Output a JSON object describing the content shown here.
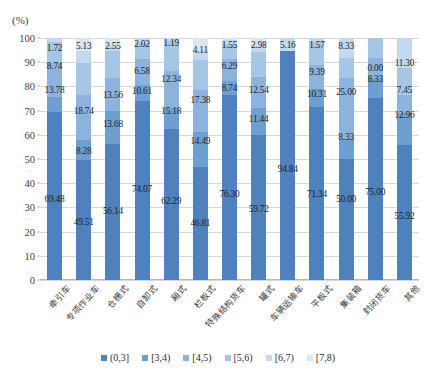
{
  "chart_data": {
    "type": "bar",
    "subtype": "stacked-100-percent",
    "title": "",
    "xlabel": "",
    "ylabel": "(%)",
    "unit_label": "(%)",
    "ylim": [
      0,
      100
    ],
    "yticks": [
      0,
      10,
      20,
      30,
      40,
      50,
      60,
      70,
      80,
      90,
      100
    ],
    "grid": true,
    "legend_position": "bottom",
    "categories": [
      "牵引车",
      "专项作业车",
      "仓栅式",
      "自卸式",
      "厢式",
      "栏板式",
      "特殊结构货车",
      "罐式",
      "车辆运输车",
      "平板式",
      "集装箱",
      "封闭货车",
      "其他"
    ],
    "series": [
      {
        "name": "(0,3]",
        "color": "#4f81bd",
        "values": [
          69.48,
          49.51,
          56.14,
          74.07,
          62.29,
          46.81,
          76.3,
          59.72,
          94.84,
          71.34,
          50.0,
          75.0,
          55.92
        ]
      },
      {
        "name": "[3,4)",
        "color": "#6f9fd0",
        "values": [
          6.28,
          8.28,
          13.68,
          6.72,
          8.81,
          14.49,
          6.12,
          11.44,
          0.0,
          7.39,
          8.33,
          8.33,
          12.96
        ]
      },
      {
        "name": "[4,5)",
        "color": "#8cb3dd",
        "values": [
          13.78,
          18.74,
          13.56,
          10.61,
          15.18,
          17.38,
          8.74,
          12.54,
          0.0,
          10.31,
          25.0,
          8.33,
          7.45
        ]
      },
      {
        "name": "[5,6)",
        "color": "#a6c6e6",
        "values": [
          8.74,
          13.13,
          11.09,
          6.58,
          12.34,
          12.11,
          6.29,
          10.34,
          0.0,
          9.39,
          8.33,
          8.33,
          11.3
        ]
      },
      {
        "name": "[6,7)",
        "color": "#c3d9ef",
        "values": [
          1.72,
          5.13,
          2.55,
          2.02,
          1.19,
          4.11,
          1.55,
          2.98,
          5.16,
          1.57,
          8.33,
          0.0,
          12.37
        ]
      },
      {
        "name": "[7,8)",
        "color": "#dce6f3",
        "values": [
          0.0,
          5.21,
          2.98,
          0.0,
          0.19,
          5.1,
          1.0,
          2.98,
          0.0,
          0.0,
          0.0,
          0.0,
          0.0
        ]
      }
    ],
    "annotations": [
      {
        "category": "牵引车",
        "labels": [
          "1.72",
          "8.74",
          "13.78",
          "69.48"
        ]
      },
      {
        "category": "专项作业车",
        "labels": [
          "5.13",
          "18.74",
          "8.28",
          "49.51"
        ]
      },
      {
        "category": "仓栅式",
        "labels": [
          "2.55",
          "13.56",
          "13.68",
          "56.14"
        ]
      },
      {
        "category": "自卸式",
        "labels": [
          "2.02",
          "6.58",
          "10.61",
          "74.07"
        ]
      },
      {
        "category": "厢式",
        "labels": [
          "1.19",
          "12.34",
          "15.18",
          "62.29"
        ]
      },
      {
        "category": "栏板式",
        "labels": [
          "4.11",
          "17.38",
          "14.49",
          "46.81"
        ]
      },
      {
        "category": "特殊结构货车",
        "labels": [
          "1.55",
          "6.29",
          "8.74",
          "76.30"
        ]
      },
      {
        "category": "罐式",
        "labels": [
          "2.98",
          "12.54",
          "11.44",
          "59.72"
        ]
      },
      {
        "category": "车辆运输车",
        "labels": [
          "5.16",
          "94.84"
        ]
      },
      {
        "category": "平板式",
        "labels": [
          "1.57",
          "9.39",
          "10.31",
          "71.34"
        ]
      },
      {
        "category": "集装箱",
        "labels": [
          "8.33",
          "25.00",
          "8.33",
          "50.00"
        ]
      },
      {
        "category": "封闭货车",
        "labels": [
          "0.00",
          "8.33",
          "75.00"
        ]
      },
      {
        "category": "其他",
        "labels": [
          "11.30",
          "7.45",
          "12.96",
          "55.92"
        ]
      }
    ],
    "value_labels": [
      {
        "col": 0,
        "text": "1.72",
        "y": 96.0
      },
      {
        "col": 0,
        "text": "8.74",
        "y": 88.5
      },
      {
        "col": 0,
        "text": "13.78",
        "y": 78.5
      },
      {
        "col": 0,
        "text": "69.48",
        "y": 33.5
      },
      {
        "col": 1,
        "text": "5.13",
        "y": 96.5
      },
      {
        "col": 1,
        "text": "18.74",
        "y": 70.0
      },
      {
        "col": 1,
        "text": "8.28",
        "y": 53.5
      },
      {
        "col": 1,
        "text": "49.51",
        "y": 24.0
      },
      {
        "col": 2,
        "text": "2.55",
        "y": 96.5
      },
      {
        "col": 2,
        "text": "13.56",
        "y": 76.5
      },
      {
        "col": 2,
        "text": "13.68",
        "y": 64.5
      },
      {
        "col": 2,
        "text": "56.14",
        "y": 28.5
      },
      {
        "col": 3,
        "text": "2.02",
        "y": 97.5
      },
      {
        "col": 3,
        "text": "6.58",
        "y": 86.5
      },
      {
        "col": 3,
        "text": "10.61",
        "y": 78.0
      },
      {
        "col": 3,
        "text": "74.07",
        "y": 37.5
      },
      {
        "col": 4,
        "text": "1.19",
        "y": 98.0
      },
      {
        "col": 4,
        "text": "12.34",
        "y": 83.0
      },
      {
        "col": 4,
        "text": "15.18",
        "y": 70.0
      },
      {
        "col": 4,
        "text": "62.29",
        "y": 32.5
      },
      {
        "col": 5,
        "text": "4.11",
        "y": 95.0
      },
      {
        "col": 5,
        "text": "17.38",
        "y": 74.5
      },
      {
        "col": 5,
        "text": "14.49",
        "y": 57.5
      },
      {
        "col": 5,
        "text": "46.81",
        "y": 23.5
      },
      {
        "col": 6,
        "text": "1.55",
        "y": 97.0
      },
      {
        "col": 6,
        "text": "6.29",
        "y": 88.5
      },
      {
        "col": 6,
        "text": "8.74",
        "y": 79.5
      },
      {
        "col": 6,
        "text": "76.30",
        "y": 35.5
      },
      {
        "col": 7,
        "text": "2.98",
        "y": 97.0
      },
      {
        "col": 7,
        "text": "12.54",
        "y": 78.5
      },
      {
        "col": 7,
        "text": "11.44",
        "y": 66.5
      },
      {
        "col": 7,
        "text": "59.72",
        "y": 29.5
      },
      {
        "col": 8,
        "text": "5.16",
        "y": 97.0
      },
      {
        "col": 8,
        "text": "94.84",
        "y": 46.0
      },
      {
        "col": 9,
        "text": "1.57",
        "y": 97.0
      },
      {
        "col": 9,
        "text": "9.39",
        "y": 86.0
      },
      {
        "col": 9,
        "text": "10.31",
        "y": 77.0
      },
      {
        "col": 9,
        "text": "71.34",
        "y": 35.5
      },
      {
        "col": 10,
        "text": "8.33",
        "y": 96.5
      },
      {
        "col": 10,
        "text": "25.00",
        "y": 77.5
      },
      {
        "col": 10,
        "text": "8.33",
        "y": 59.0
      },
      {
        "col": 10,
        "text": "50.00",
        "y": 33.5
      },
      {
        "col": 11,
        "text": "0.00",
        "y": 87.5
      },
      {
        "col": 11,
        "text": "8.33",
        "y": 83.0
      },
      {
        "col": 11,
        "text": "75.00",
        "y": 36.5
      },
      {
        "col": 12,
        "text": "11.30",
        "y": 89.5
      },
      {
        "col": 12,
        "text": "7.45",
        "y": 78.5
      },
      {
        "col": 12,
        "text": "12.96",
        "y": 68.0
      },
      {
        "col": 12,
        "text": "55.92",
        "y": 26.5
      }
    ]
  },
  "legend": {
    "items": [
      {
        "label": "(0,3]",
        "color": "#4f81bd"
      },
      {
        "label": "[3,4)",
        "color": "#6f9fd0"
      },
      {
        "label": "[4,5)",
        "color": "#8cb3dd"
      },
      {
        "label": "[5,6)",
        "color": "#a6c6e6"
      },
      {
        "label": "[6,7)",
        "color": "#c3d9ef"
      },
      {
        "label": "[7,8)",
        "color": "#dce6f3"
      }
    ]
  }
}
